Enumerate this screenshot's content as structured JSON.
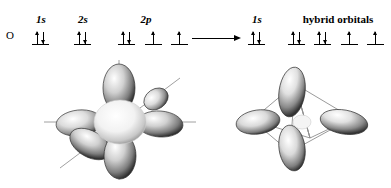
{
  "figure": {
    "atom_label": "O"
  },
  "left_configuration": {
    "headers": [
      {
        "label": "1s",
        "italic_part": "s"
      },
      {
        "label": "2s",
        "italic_part": "s"
      },
      {
        "label": "2p",
        "italic_part": "p"
      }
    ],
    "orbitals": [
      {
        "name": "1s",
        "electrons": [
          "up",
          "down"
        ]
      },
      {
        "name": "2s",
        "electrons": [
          "up",
          "down"
        ]
      },
      {
        "name": "2p-x",
        "electrons": [
          "up",
          "down"
        ]
      },
      {
        "name": "2p-y",
        "electrons": [
          "up"
        ]
      },
      {
        "name": "2p-z",
        "electrons": [
          "up"
        ]
      }
    ]
  },
  "transformation": {
    "arrow": "right-arrow"
  },
  "right_configuration": {
    "headers": [
      {
        "label": "1s",
        "italic_part": "s"
      },
      {
        "label": "hybrid orbitals",
        "italic_part": ""
      }
    ],
    "orbitals": [
      {
        "name": "1s",
        "electrons": [
          "up",
          "down"
        ]
      },
      {
        "name": "hybrid-1",
        "electrons": [
          "up",
          "down"
        ]
      },
      {
        "name": "hybrid-2",
        "electrons": [
          "up",
          "down"
        ]
      },
      {
        "name": "hybrid-3",
        "electrons": [
          "up"
        ]
      },
      {
        "name": "hybrid-4",
        "electrons": [
          "up"
        ]
      }
    ]
  },
  "illustrations": {
    "left": {
      "name": "atomic-orbitals-illustration",
      "description": "s and three p atomic orbitals with axes"
    },
    "right": {
      "name": "sp3-hybrid-orbitals-illustration",
      "description": "four sp3 hybrid orbitals in tetrahedral arrangement"
    }
  },
  "colors": {
    "ink": "#000000",
    "background": "#ffffff",
    "lobe_dark": "#3a3a3a",
    "lobe_mid": "#8d8d8d",
    "lobe_light": "#e8e8e8",
    "axis": "#9a9a9a"
  }
}
